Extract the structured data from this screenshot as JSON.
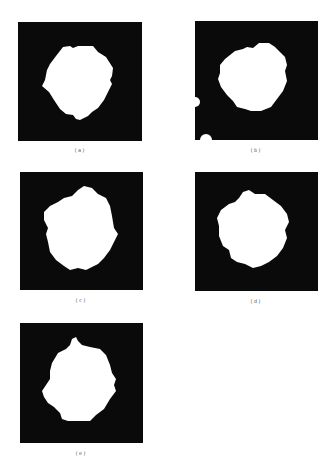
{
  "figure": {
    "colors": {
      "background": "#ffffff",
      "frame": "#0a0a0a",
      "blob": "#ffffff",
      "caption": "#555555"
    },
    "panels": [
      {
        "id": "a",
        "caption": "(a)",
        "description": "binary mask, irregular white blob centered on black square"
      },
      {
        "id": "b",
        "caption": "(b)",
        "description": "binary mask, irregular white blob with two small white spots on left/bottom-left edge"
      },
      {
        "id": "c",
        "caption": "(c)",
        "description": "binary mask, irregular white blob"
      },
      {
        "id": "d",
        "caption": "(d)",
        "description": "binary mask, irregular white blob"
      },
      {
        "id": "e",
        "caption": "(e)",
        "description": "binary mask, irregular white blob with protrusion at top"
      }
    ]
  }
}
